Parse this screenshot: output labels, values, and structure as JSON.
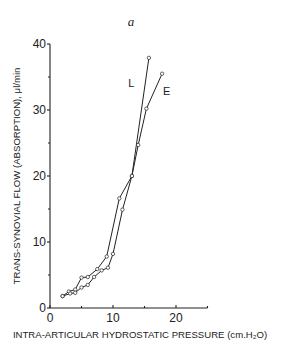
{
  "chart_data": {
    "type": "line",
    "title": "a",
    "xlabel": "INTRA-ARTICULAR HYDROSTATIC PRESSURE (cm.H₂O)",
    "ylabel": "TRANS-SYNOVIAL FLOW (ABSORPTION), μl/min",
    "xlim": [
      0,
      25
    ],
    "ylim": [
      0,
      40
    ],
    "xticks": [
      0,
      10,
      20
    ],
    "xminor_ticks": [
      5,
      15,
      25
    ],
    "yticks": [
      0,
      10,
      20,
      30,
      40
    ],
    "yminor_ticks": [
      5,
      15,
      25,
      35
    ],
    "grid": false,
    "legend": "inline labels next to curve ends",
    "series": [
      {
        "name": "L",
        "label_pos": [
          12.9,
          33.5
        ],
        "x": [
          2,
          3,
          4,
          5,
          6,
          7.5,
          9,
          11,
          13,
          15.7
        ],
        "y": [
          1.8,
          2.5,
          2.8,
          4.6,
          4.7,
          5.9,
          7.8,
          16.6,
          20,
          37.9
        ]
      },
      {
        "name": "E",
        "label_pos": [
          18.5,
          32.3
        ],
        "x": [
          2,
          3.2,
          4,
          5,
          6,
          7,
          8.2,
          9.2,
          10,
          11.5,
          13,
          14,
          15.3,
          17.8
        ],
        "y": [
          1.8,
          2.2,
          2.3,
          3.1,
          3.5,
          4.7,
          5.7,
          6.1,
          8.2,
          14.9,
          20,
          24.7,
          30.2,
          35.5
        ]
      }
    ]
  }
}
